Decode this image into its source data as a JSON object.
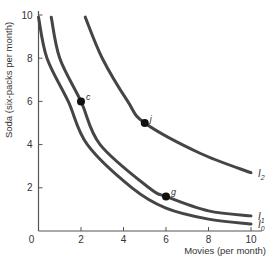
{
  "chart_data": {
    "type": "line",
    "title": "",
    "xlabel": "Movies (per month)",
    "ylabel": "Soda (six-packs per month)",
    "xlim": [
      0,
      10
    ],
    "ylim": [
      0,
      10
    ],
    "xticks": [
      0,
      2,
      4,
      6,
      8,
      10
    ],
    "yticks": [
      2,
      4,
      6,
      8,
      10
    ],
    "grid": false,
    "legend": "inline labels at right end of curves",
    "series": [
      {
        "name": "I0",
        "label_main": "I",
        "label_sub": "0",
        "points": [
          [
            0.0,
            9.9
          ],
          [
            0.4,
            8.0
          ],
          [
            1.4,
            6.0
          ],
          [
            2.3,
            4.0
          ],
          [
            4.4,
            2.0
          ],
          [
            6.0,
            1.06
          ],
          [
            8.0,
            0.55
          ],
          [
            10.0,
            0.32
          ]
        ]
      },
      {
        "name": "I1",
        "label_main": "I",
        "label_sub": "1",
        "points": [
          [
            0.6,
            9.9
          ],
          [
            1.0,
            8.0
          ],
          [
            2.0,
            6.0
          ],
          [
            2.9,
            4.0
          ],
          [
            5.2,
            2.0
          ],
          [
            6.0,
            1.6
          ],
          [
            8.0,
            0.93
          ],
          [
            10.0,
            0.7
          ]
        ]
      },
      {
        "name": "I2",
        "label_main": "I",
        "label_sub": "2",
        "points": [
          [
            2.2,
            9.9
          ],
          [
            3.0,
            8.0
          ],
          [
            4.2,
            6.0
          ],
          [
            5.0,
            5.0
          ],
          [
            7.6,
            3.6
          ],
          [
            10.0,
            2.7
          ]
        ]
      }
    ],
    "annotations": [
      {
        "label": "c",
        "x": 2,
        "y": 6,
        "curve": "I1"
      },
      {
        "label": "j",
        "x": 5,
        "y": 5,
        "curve": "I2"
      },
      {
        "label": "g",
        "x": 6,
        "y": 1.6,
        "curve": "I1"
      }
    ],
    "colors": {
      "curve": "#454545",
      "axis": "#555555",
      "point": "#111111"
    }
  }
}
